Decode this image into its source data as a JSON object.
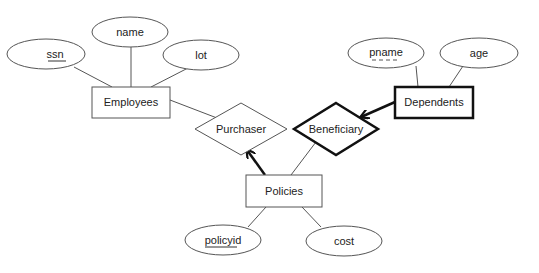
{
  "diagram": {
    "type": "er-diagram",
    "entities": [
      {
        "id": "employees",
        "label": "Employees",
        "weak": false
      },
      {
        "id": "dependents",
        "label": "Dependents",
        "weak": true
      },
      {
        "id": "policies",
        "label": "Policies",
        "weak": false
      }
    ],
    "relationships": [
      {
        "id": "purchaser",
        "label": "Purchaser",
        "identifying": false
      },
      {
        "id": "beneficiary",
        "label": "Beneficiary",
        "identifying": true
      }
    ],
    "attributes": [
      {
        "id": "ssn",
        "label": "ssn",
        "entity": "employees",
        "key": "primary"
      },
      {
        "id": "name",
        "label": "name",
        "entity": "employees",
        "key": "none"
      },
      {
        "id": "lot",
        "label": "lot",
        "entity": "employees",
        "key": "none"
      },
      {
        "id": "pname",
        "label": "pname",
        "entity": "dependents",
        "key": "partial"
      },
      {
        "id": "age",
        "label": "age",
        "entity": "dependents",
        "key": "none"
      },
      {
        "id": "policyid",
        "label": "policyid",
        "entity": "policies",
        "key": "primary"
      },
      {
        "id": "cost",
        "label": "cost",
        "entity": "policies",
        "key": "none"
      }
    ],
    "connections": [
      {
        "from": "employees",
        "to": "purchaser",
        "style": "thin"
      },
      {
        "from": "policies",
        "to": "purchaser",
        "style": "bold-arrow"
      },
      {
        "from": "policies",
        "to": "beneficiary",
        "style": "thin"
      },
      {
        "from": "dependents",
        "to": "beneficiary",
        "style": "bold-arrow"
      }
    ]
  }
}
